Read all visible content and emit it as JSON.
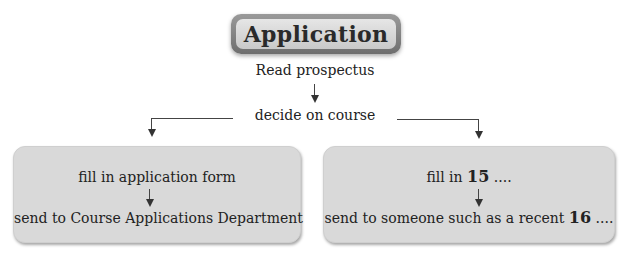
{
  "title": "Application",
  "steps": {
    "read": "Read prospectus",
    "decide": "decide on course"
  },
  "left_box": {
    "step1": "fill in application form",
    "step2": "send to Course Applications Department"
  },
  "right_box": {
    "step1_prefix": "fill in",
    "step1_num": "15",
    "step1_suffix": "....",
    "step2_prefix": "send to someone such as a recent",
    "step2_num": "16",
    "step2_suffix": "...."
  }
}
